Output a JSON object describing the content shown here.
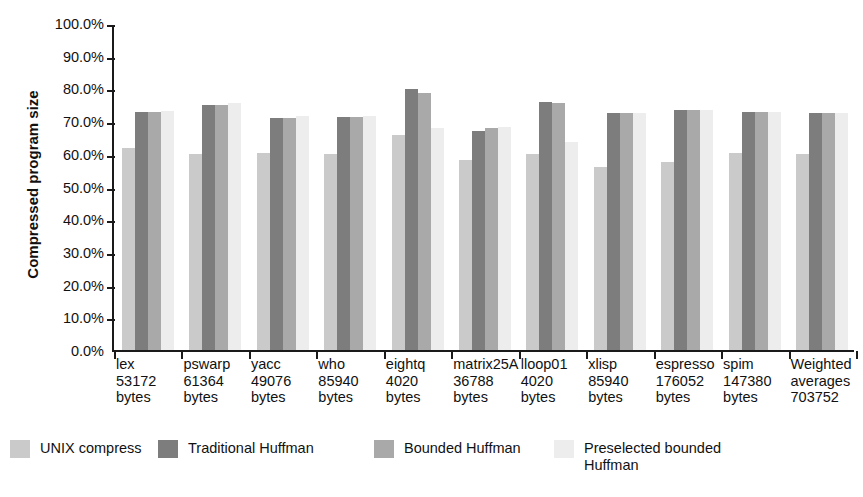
{
  "chart_data": {
    "type": "bar",
    "title": "",
    "xlabel": "",
    "ylabel": "Compressed program size",
    "ylim": [
      0,
      100
    ],
    "ytick_labels": [
      "100.0%",
      "90.0%",
      "80.0%",
      "70.0%",
      "60.0%",
      "50.0%",
      "40.0%",
      "30.0%",
      "20.0%",
      "10.0%",
      "0.0%"
    ],
    "ytick_values": [
      100,
      90,
      80,
      70,
      60,
      50,
      40,
      30,
      20,
      10,
      0
    ],
    "grid": false,
    "legend_position": "bottom",
    "categories": [
      "lex\n53172\nbytes",
      "pswarp\n61364\nbytes",
      "yacc\n49076\nbytes",
      "who\n85940\nbytes",
      "eightq\n4020\nbytes",
      "matrix25A\n36788\nbytes",
      "lloop01\n4020\nbytes",
      "xlisp\n85940\nbytes",
      "espresso\n176052\nbytes",
      "spim\n147380\nbytes",
      "Weighted\naverages\n703752"
    ],
    "category_lines": [
      [
        "lex",
        "53172",
        "bytes"
      ],
      [
        "pswarp",
        "61364",
        "bytes"
      ],
      [
        "yacc",
        "49076",
        "bytes"
      ],
      [
        "who",
        "85940",
        "bytes"
      ],
      [
        "eightq",
        "4020",
        "bytes"
      ],
      [
        "matrix25A",
        "36788",
        "bytes"
      ],
      [
        "lloop01",
        "4020",
        "bytes"
      ],
      [
        "xlisp",
        "85940",
        "bytes"
      ],
      [
        "espresso",
        "176052",
        "bytes"
      ],
      [
        "spim",
        "147380",
        "bytes"
      ],
      [
        "Weighted",
        "averages",
        "703752"
      ]
    ],
    "series": [
      {
        "name": "UNIX compress",
        "color": "#cacaca",
        "values": [
          61.8,
          60.0,
          60.3,
          60.0,
          65.7,
          58.2,
          60.0,
          56.0,
          57.6,
          60.1,
          60.0
        ]
      },
      {
        "name": "Traditional Huffman",
        "color": "#7d7d7d",
        "values": [
          72.9,
          75.0,
          71.0,
          71.2,
          79.9,
          66.9,
          75.7,
          72.4,
          73.5,
          72.7,
          72.4
        ]
      },
      {
        "name": "Bounded Huffman",
        "color": "#a9a9a9",
        "values": [
          72.7,
          75.0,
          71.0,
          71.2,
          78.7,
          67.8,
          75.6,
          72.4,
          73.4,
          72.7,
          72.4
        ]
      },
      {
        "name": "Preselected bounded Huffman",
        "color": "#ededed",
        "values": [
          73.0,
          75.4,
          71.6,
          71.6,
          67.8,
          68.3,
          63.5,
          72.6,
          73.5,
          72.9,
          72.6
        ]
      }
    ]
  },
  "legend": {
    "items": [
      {
        "label": "UNIX compress",
        "color": "#cacaca"
      },
      {
        "label": "Traditional Huffman",
        "color": "#7d7d7d"
      },
      {
        "label": "Bounded Huffman",
        "color": "#a9a9a9"
      },
      {
        "label": "Preselected bounded Huffman",
        "color": "#ededed"
      }
    ]
  }
}
